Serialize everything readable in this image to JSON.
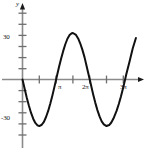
{
  "chart_data": {
    "type": "line",
    "title": "",
    "xlabel": "",
    "ylabel": "y",
    "axis_labels": {
      "y_axis_name": "y",
      "x_axis_name": ""
    },
    "x_tick_labels": [
      "π",
      "2π",
      "3π"
    ],
    "x_tick_values": [
      3.14159,
      6.28319,
      9.42478
    ],
    "y_tick_labels": [
      "30",
      "-30"
    ],
    "y_tick_values": [
      30,
      -30
    ],
    "xlim": [
      -0.35,
      10.9
    ],
    "ylim": [
      -52,
      52
    ],
    "grid": false,
    "legend": null,
    "series": [
      {
        "name": "curve",
        "equation": "y = -33 sin(x)",
        "color": "#111111",
        "x": [
          0.0,
          0.2,
          0.4,
          0.6,
          0.8,
          1.0,
          1.2,
          1.4,
          1.5708,
          1.8,
          2.0,
          2.2,
          2.4,
          2.6,
          2.8,
          3.0,
          3.14159,
          3.4,
          3.6,
          3.8,
          4.0,
          4.2,
          4.4,
          4.6,
          4.71239,
          5.0,
          5.2,
          5.4,
          5.6,
          5.8,
          6.0,
          6.28319,
          6.6,
          6.8,
          7.0,
          7.2,
          7.4,
          7.6,
          7.85398,
          8.1,
          8.3,
          8.5,
          8.8,
          9.0,
          9.2,
          9.42478,
          9.7,
          10.0,
          10.3,
          10.6
        ],
        "y": [
          0.0,
          -6.6,
          -12.9,
          -18.6,
          -23.7,
          -27.8,
          -30.8,
          -32.5,
          -33.0,
          -32.1,
          -30.0,
          -26.6,
          -22.3,
          -17.0,
          -11.1,
          -4.7,
          0.0,
          8.5,
          14.5,
          20.1,
          25.0,
          28.9,
          31.5,
          32.8,
          33.0,
          31.6,
          29.1,
          25.5,
          21.0,
          15.7,
          9.2,
          0.0,
          -10.4,
          -16.4,
          -21.7,
          -26.2,
          -29.7,
          -31.8,
          -33.0,
          -32.3,
          -30.5,
          -27.7,
          -22.1,
          -17.4,
          -12.1,
          -5.4,
          3.7,
          12.6,
          22.0,
          29.4
        ]
      }
    ],
    "features": {
      "first_trough": {
        "x": 1.5708,
        "y": -30
      },
      "peak": {
        "x": 4.71239,
        "y": 33
      },
      "second_trough": {
        "x": 7.85398,
        "y": -30
      },
      "zero_crossings": [
        0,
        3.14159,
        6.28319,
        9.42478
      ]
    },
    "colors": {
      "curve": "#111111",
      "x_axis": "#8a8a8a",
      "y_axis": "#8a8a8a",
      "ticks": "#6e6e6e",
      "background": "#ffffff",
      "text": "#1a1a1a"
    }
  }
}
